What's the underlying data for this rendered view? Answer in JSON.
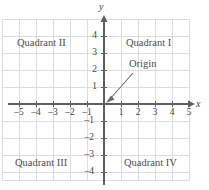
{
  "figure": {
    "type": "cartesian-coordinate-plane",
    "background_color": "#ffffff",
    "grid_color": "#d9d9d9",
    "axis_color": "#5a5a5a",
    "text_color": "#4a4a4a",
    "grid": {
      "visible": true,
      "x_min": -6,
      "x_max": 5,
      "y_min": -5,
      "y_max": 5,
      "unit_px": 17
    },
    "axes": {
      "x_label": "x",
      "y_label": "y",
      "x_arrow": true,
      "y_arrow": true
    },
    "x_ticks": [
      {
        "value": -5,
        "label": "–5"
      },
      {
        "value": -4,
        "label": "–4"
      },
      {
        "value": -3,
        "label": "–3"
      },
      {
        "value": -2,
        "label": "–2"
      },
      {
        "value": -1,
        "label": "–1"
      },
      {
        "value": 1,
        "label": "1"
      },
      {
        "value": 2,
        "label": "2"
      },
      {
        "value": 3,
        "label": "3"
      },
      {
        "value": 4,
        "label": "4"
      },
      {
        "value": 5,
        "label": "5"
      }
    ],
    "y_ticks": [
      {
        "value": 4,
        "label": "4"
      },
      {
        "value": 3,
        "label": "3"
      },
      {
        "value": 2,
        "label": "2"
      },
      {
        "value": 1,
        "label": "1"
      },
      {
        "value": -1,
        "label": "–1"
      },
      {
        "value": -2,
        "label": "–2"
      },
      {
        "value": -3,
        "label": "–3"
      },
      {
        "value": -4,
        "label": "–4"
      }
    ],
    "quadrants": [
      {
        "id": "I",
        "label": "Quadrant I",
        "x": 2.9,
        "y": 3.4
      },
      {
        "id": "II",
        "label": "Quadrant II",
        "x": -3.1,
        "y": 3.4
      },
      {
        "id": "III",
        "label": "Quadrant III",
        "x": -3.1,
        "y": -3.6
      },
      {
        "id": "IV",
        "label": "Quadrant IV",
        "x": 2.9,
        "y": -3.6
      }
    ],
    "annotations": [
      {
        "name": "origin",
        "label": "Origin",
        "text_x": 1.6,
        "text_y": 2.2,
        "target_x": 0,
        "target_y": 0,
        "arrow": true
      }
    ]
  }
}
